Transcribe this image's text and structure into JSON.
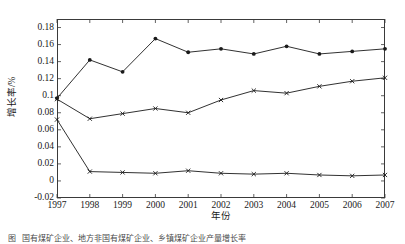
{
  "figure": {
    "caption_label": "图",
    "caption_text": "国有煤矿企业、地方非国有煤矿企业、乡镇煤矿企业产量增长率"
  },
  "axes": {
    "ylabel": "增长率/%",
    "xlabel": "年份",
    "yticks": [
      "0.18",
      "0.16",
      "0.14",
      "0.12",
      "0.1",
      "0.08",
      "0.06",
      "0.04",
      "0.02",
      "0",
      "-0.02"
    ],
    "xticks": [
      "1997",
      "1998",
      "1999",
      "2000",
      "2001",
      "2002",
      "2003",
      "2004",
      "2005",
      "2006",
      "2007"
    ]
  },
  "style": {
    "line_color": "#1a1a1a",
    "frame_color": "#3a3a3a",
    "background": "#ffffff"
  },
  "chart_data": {
    "type": "line",
    "title": "",
    "xlabel": "年份",
    "ylabel": "增长率/%",
    "x": [
      1997,
      1998,
      1999,
      2000,
      2001,
      2002,
      2003,
      2004,
      2005,
      2006,
      2007
    ],
    "xlim": [
      1997,
      2007
    ],
    "ylim": [
      -0.02,
      0.19
    ],
    "ytick_values": [
      0.18,
      0.16,
      0.14,
      0.12,
      0.1,
      0.08,
      0.06,
      0.04,
      0.02,
      0,
      -0.02
    ],
    "grid": false,
    "legend": "none",
    "series": [
      {
        "name": "series-1",
        "marker": "dot",
        "values": [
          0.097,
          0.142,
          0.128,
          0.167,
          0.151,
          0.155,
          0.149,
          0.158,
          0.149,
          0.152,
          0.155
        ]
      },
      {
        "name": "series-2",
        "marker": "cross",
        "values": [
          0.096,
          0.073,
          0.079,
          0.085,
          0.08,
          0.095,
          0.106,
          0.103,
          0.111,
          0.117,
          0.121
        ]
      },
      {
        "name": "series-3",
        "marker": "cross",
        "values": [
          0.072,
          0.011,
          0.01,
          0.009,
          0.012,
          0.009,
          0.008,
          0.009,
          0.007,
          0.006,
          0.007
        ]
      }
    ]
  }
}
